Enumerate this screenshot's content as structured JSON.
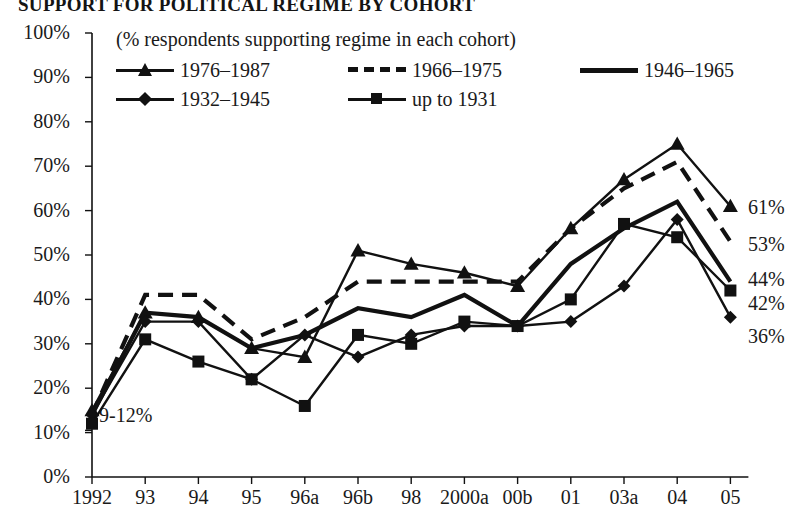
{
  "title": "SUPPORT FOR POLITICAL REGIME BY COHORT",
  "subtitle": "(% respondents supporting regime in each cohort)",
  "annotations": {
    "start_range": "9-12%"
  },
  "axes": {
    "y_ticks": [
      "100%",
      "90%",
      "80%",
      "70%",
      "60%",
      "50%",
      "40%",
      "30%",
      "20%",
      "10%",
      "0%"
    ],
    "y_min": 0,
    "y_max": 100,
    "y_step": 10,
    "x_ticks": [
      "1992",
      "93",
      "94",
      "95",
      "96a",
      "96b",
      "98",
      "2000a",
      "00b",
      "01",
      "03a",
      "04",
      "05"
    ],
    "grid": false
  },
  "legend": {
    "position": "top",
    "entries": [
      {
        "label": "1976–1987",
        "marker": "triangle",
        "style": "solid"
      },
      {
        "label": "1966–1975",
        "marker": "none",
        "style": "dashed"
      },
      {
        "label": "1946–1965",
        "marker": "none",
        "style": "solid-thick"
      },
      {
        "label": "1932–1945",
        "marker": "diamond",
        "style": "solid"
      },
      {
        "label": "up to 1931",
        "marker": "square",
        "style": "solid"
      }
    ]
  },
  "end_labels": [
    "61%",
    "53%",
    "44%",
    "42%",
    "36%"
  ],
  "colors": {
    "ink": "#111111",
    "background": "#ffffff"
  },
  "chart_data": {
    "type": "line",
    "title": "SUPPORT FOR POLITICAL REGIME BY COHORT",
    "subtitle": "(% respondents supporting regime in each cohort)",
    "xlabel": "",
    "ylabel": "",
    "ylim": [
      0,
      100
    ],
    "y_tick_step": 10,
    "categories": [
      "1992",
      "93",
      "94",
      "95",
      "96a",
      "96b",
      "98",
      "2000a",
      "00b",
      "01",
      "03a",
      "04",
      "05"
    ],
    "series": [
      {
        "name": "1976–1987",
        "marker": "triangle",
        "style": "solid",
        "values": [
          15,
          37,
          36,
          29,
          27,
          51,
          48,
          46,
          43,
          56,
          67,
          75,
          61
        ],
        "end_label": "61%"
      },
      {
        "name": "1966–1975",
        "marker": "none",
        "style": "dashed",
        "values": [
          14,
          41,
          41,
          31,
          36,
          44,
          44,
          44,
          44,
          56,
          65,
          71,
          53
        ],
        "end_label": "53%"
      },
      {
        "name": "1946–1965",
        "marker": "none",
        "style": "solid-thick",
        "values": [
          14,
          37,
          36,
          29,
          32,
          38,
          36,
          41,
          34,
          48,
          56,
          62,
          44
        ],
        "end_label": "44%"
      },
      {
        "name": "1932–1945",
        "marker": "diamond",
        "style": "solid",
        "values": [
          14,
          35,
          35,
          22,
          32,
          27,
          32,
          34,
          34,
          35,
          43,
          58,
          36
        ],
        "end_label": "36%"
      },
      {
        "name": "up to 1931",
        "marker": "square",
        "style": "solid",
        "values": [
          12,
          31,
          26,
          22,
          16,
          32,
          30,
          35,
          34,
          40,
          57,
          54,
          42
        ],
        "end_label": "42%"
      }
    ]
  }
}
